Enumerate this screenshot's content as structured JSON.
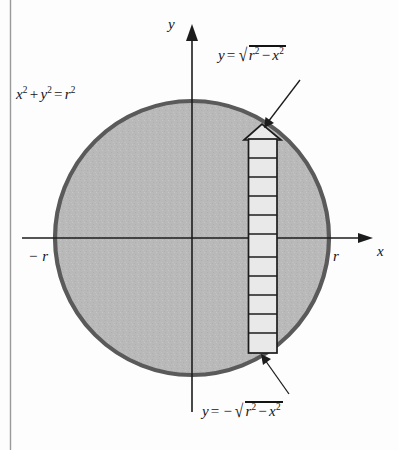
{
  "figure": {
    "name": "circle-area-vertical-strip-diagram",
    "caption_equations": {
      "circle_equation": "x² + y² = r²",
      "upper_semicircle": "y = √(r² − x²)",
      "lower_semicircle": "y = −√(r² − x²)"
    },
    "axes": {
      "x_label": "x",
      "y_label": "y",
      "tick_left_label": "− r",
      "tick_right_label": "r"
    },
    "parts": {
      "x_var": "x",
      "y_var": "y",
      "r_var": "r",
      "equals": "=",
      "plus": "+",
      "minus": "−",
      "radical_sign": "√",
      "exp_two": "2"
    },
    "colors": {
      "disk_fill": "#b9b9b9",
      "disk_stroke": "#5a5a5a",
      "strip_fill": "#e9e9e9",
      "strip_stroke": "#1c1c1c",
      "axis": "#1c1c1c",
      "background": "#fdfdfd",
      "text": "#141414"
    },
    "geometry": {
      "center_x": 192,
      "center_y": 238,
      "radius": 137,
      "strip_left": 248,
      "strip_right": 277,
      "strip_top": 139,
      "strip_bottom": 353,
      "strip_rung_count": 11,
      "arrow_apex_y": 124
    }
  }
}
